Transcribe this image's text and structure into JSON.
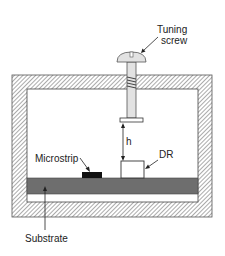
{
  "diagram": {
    "type": "cross-section schematic",
    "labels": {
      "tuning_screw_line1": "Tuning",
      "tuning_screw_line2": "screw",
      "microstrip": "Microstrip",
      "dr": "DR",
      "h": "h",
      "substrate": "Substrate"
    },
    "components": [
      {
        "id": "enclosure",
        "description": "Metal enclosure (hatched walls)"
      },
      {
        "id": "tuning-screw",
        "description": "Tuning screw through top wall"
      },
      {
        "id": "dielectric-resonator",
        "description": "DR block on substrate"
      },
      {
        "id": "microstrip",
        "description": "Microstrip line on substrate"
      },
      {
        "id": "substrate",
        "description": "Substrate layer (dark gray)"
      },
      {
        "id": "gap-h",
        "description": "Distance h between screw tip and DR"
      }
    ],
    "colors": {
      "hatch_line": "#555555",
      "substrate": "#6e6e6e",
      "microstrip": "#111111",
      "screw_fill": "#e2e2e2",
      "outline": "#333333"
    }
  }
}
